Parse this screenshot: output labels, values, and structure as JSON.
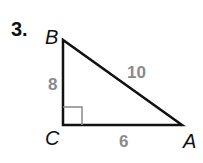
{
  "problem": {
    "number": "3.",
    "vertices": {
      "B": "B",
      "C": "C",
      "A": "A"
    },
    "sides": {
      "BC": "8",
      "AB": "10",
      "CA": "6"
    },
    "right_angle_at": "C"
  },
  "colors": {
    "line": "#111111",
    "side_label": "#8a8a8a",
    "right_angle_mark": "#888888"
  }
}
